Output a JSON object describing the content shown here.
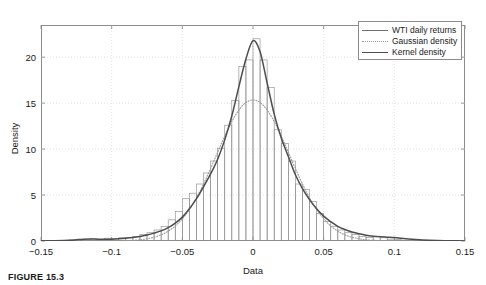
{
  "figure": {
    "caption": "FIGURE 15.3",
    "axis_titles": {
      "x": "Data",
      "y": "Density"
    }
  },
  "legend": {
    "position": "top-right",
    "entries": [
      {
        "label": "WTI daily returns",
        "style": "thin-solid",
        "color": "#6e6e6e"
      },
      {
        "label": "Gaussian density",
        "style": "dotted",
        "color": "#9a9a9a"
      },
      {
        "label": "Kernel density",
        "style": "thick-solid",
        "color": "#4d4d4d"
      }
    ]
  },
  "chart_data": {
    "type": "histogram",
    "title": "",
    "subtitle": "",
    "xlabel": "Data",
    "ylabel": "Density",
    "xlim": [
      -0.15,
      0.15
    ],
    "ylim": [
      0,
      23.5
    ],
    "xticks": [
      -0.15,
      -0.1,
      -0.05,
      0,
      0.05,
      0.1,
      0.15
    ],
    "xticklabels": [
      "-0.15",
      "-0.1",
      "-0.05",
      "0",
      "0.05",
      "0.1",
      "0.15"
    ],
    "yticks": [
      0,
      5,
      10,
      15,
      20
    ],
    "yticklabels": [
      "0",
      "5",
      "10",
      "15",
      "20"
    ],
    "grid": true,
    "grid_color": "#d9d9d9",
    "bin_width": 0.005,
    "histogram": {
      "name": "WTI daily returns",
      "bin_centers": [
        -0.1275,
        -0.1225,
        -0.1175,
        -0.1125,
        -0.1075,
        -0.1025,
        -0.0975,
        -0.0925,
        -0.0875,
        -0.0825,
        -0.0775,
        -0.0725,
        -0.0675,
        -0.0625,
        -0.0575,
        -0.0525,
        -0.0475,
        -0.0425,
        -0.0375,
        -0.0325,
        -0.0275,
        -0.0225,
        -0.0175,
        -0.0125,
        -0.0075,
        -0.0025,
        0.0025,
        0.0075,
        0.0125,
        0.0175,
        0.0225,
        0.0275,
        0.0325,
        0.0375,
        0.0425,
        0.0475,
        0.0525,
        0.0575,
        0.0625,
        0.0675,
        0.0725,
        0.0775,
        0.0825,
        0.0875,
        0.0925,
        0.0975,
        0.1025
      ],
      "counts": [
        0.12,
        0.18,
        0.1,
        0.22,
        0.15,
        0.3,
        0.25,
        0.35,
        0.4,
        0.5,
        0.7,
        0.9,
        1.2,
        1.6,
        2.3,
        3.2,
        4.6,
        5.2,
        6.2,
        7.4,
        8.7,
        10.1,
        12.6,
        15.3,
        19.0,
        19.7,
        22.0,
        19.7,
        16.7,
        12.1,
        10.6,
        8.7,
        6.2,
        5.6,
        4.3,
        3.0,
        2.1,
        1.6,
        1.2,
        0.9,
        0.7,
        0.5,
        0.4,
        0.5,
        0.35,
        0.2,
        0.15
      ]
    },
    "series": [
      {
        "name": "Gaussian density",
        "style": "dotted",
        "color": "#9a9a9a",
        "mean": 0.0,
        "sigma": 0.026,
        "peak": 15.34
      },
      {
        "name": "Kernel density",
        "style": "thick-solid",
        "color": "#4d4d4d",
        "peak": 22.0,
        "peak_x": 0.0,
        "x": [
          -0.15,
          -0.14,
          -0.13,
          -0.125,
          -0.12,
          -0.115,
          -0.11,
          -0.105,
          -0.1,
          -0.095,
          -0.09,
          -0.085,
          -0.08,
          -0.075,
          -0.07,
          -0.065,
          -0.06,
          -0.055,
          -0.05,
          -0.045,
          -0.04,
          -0.035,
          -0.03,
          -0.025,
          -0.02,
          -0.015,
          -0.01,
          -0.005,
          0.0,
          0.005,
          0.01,
          0.015,
          0.02,
          0.025,
          0.03,
          0.035,
          0.04,
          0.045,
          0.05,
          0.055,
          0.06,
          0.065,
          0.07,
          0.075,
          0.08,
          0.085,
          0.09,
          0.095,
          0.1,
          0.105,
          0.11,
          0.12,
          0.13,
          0.14,
          0.15
        ],
        "y": [
          0.02,
          0.04,
          0.08,
          0.14,
          0.2,
          0.22,
          0.2,
          0.18,
          0.2,
          0.24,
          0.3,
          0.38,
          0.5,
          0.66,
          0.86,
          1.1,
          1.45,
          1.95,
          2.6,
          3.5,
          4.6,
          5.9,
          7.3,
          8.9,
          11.0,
          13.6,
          16.8,
          19.8,
          21.8,
          20.6,
          17.2,
          13.8,
          11.2,
          9.2,
          7.2,
          5.7,
          4.5,
          3.5,
          2.7,
          2.1,
          1.6,
          1.25,
          0.98,
          0.78,
          0.62,
          0.52,
          0.46,
          0.42,
          0.38,
          0.3,
          0.22,
          0.12,
          0.06,
          0.03,
          0.01
        ]
      }
    ]
  }
}
